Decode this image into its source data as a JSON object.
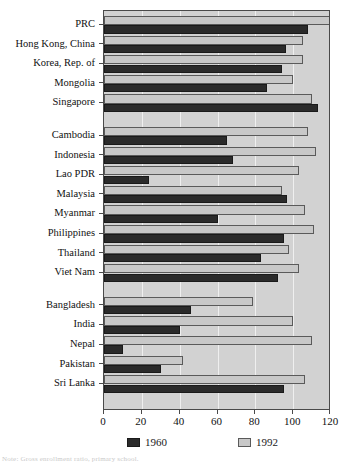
{
  "chart_data": {
    "type": "bar",
    "orientation": "horizontal",
    "title": "",
    "xlabel": "",
    "ylabel": "",
    "xlim": [
      0,
      120
    ],
    "xticks": [
      0,
      20,
      40,
      60,
      80,
      100,
      120
    ],
    "xtick_labels": [
      "0",
      "20",
      "40",
      "60",
      "80",
      "100",
      "120"
    ],
    "grid": true,
    "legend_position": "bottom",
    "series": [
      {
        "name": "1960",
        "color": "#2b2b2b",
        "values": [
          108,
          96,
          94,
          86,
          113,
          65,
          68,
          24,
          97,
          60,
          95,
          83,
          92,
          46,
          40,
          10,
          30,
          95
        ]
      },
      {
        "name": "1992",
        "color": "#c8c8c8",
        "values": [
          120,
          105,
          105,
          100,
          110,
          108,
          112,
          103,
          94,
          106,
          111,
          98,
          103,
          79,
          100,
          110,
          42,
          106
        ]
      }
    ],
    "categories": [
      "PRC",
      "Hong Kong, China",
      "Korea, Rep. of",
      "Mongolia",
      "Singapore",
      "Cambodia",
      "Indonesia",
      "Lao PDR",
      "Malaysia",
      "Myanmar",
      "Philippines",
      "Thailand",
      "Viet Nam",
      "Bangladesh",
      "India",
      "Nepal",
      "Pakistan",
      "Sri Lanka"
    ],
    "groups": [
      {
        "name": "East Asia",
        "start": 0,
        "count": 5
      },
      {
        "name": "Southeast Asia",
        "start": 5,
        "count": 8
      },
      {
        "name": "South Asia",
        "start": 13,
        "count": 5
      }
    ]
  },
  "legend": {
    "entries": [
      {
        "label": "1960",
        "swatch": "swatch-1960"
      },
      {
        "label": "1992",
        "swatch": "swatch-1992"
      }
    ]
  },
  "footnote": "Note: Gross enrollment ratio, primary school."
}
